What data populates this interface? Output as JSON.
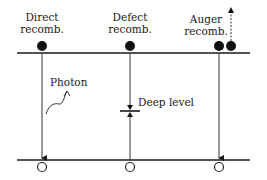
{
  "diagram": {
    "labels": {
      "direct": [
        "Direct",
        "recomb."
      ],
      "defect": [
        "Defect",
        "recomb."
      ],
      "auger": [
        "Auger",
        "recomb."
      ],
      "photon": "Photon",
      "deep_level": "Deep level"
    },
    "bands": {
      "conduction_band_y": 53,
      "valence_band_y": 160,
      "x_start": 17,
      "x_end": 250
    },
    "colors": {
      "line": "#1a1a1a",
      "background": "#ffffff"
    }
  }
}
